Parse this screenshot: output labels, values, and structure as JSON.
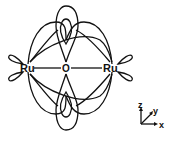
{
  "diagram": {
    "title": "",
    "atoms": [
      {
        "id": "ru-left",
        "label": "Ru",
        "x": 28,
        "y": 68
      },
      {
        "id": "o-center",
        "label": "O",
        "x": 66,
        "y": 68
      },
      {
        "id": "ru-right",
        "label": "Ru",
        "x": 112,
        "y": 68
      }
    ],
    "axes": {
      "z_label": "z",
      "y_label": "y",
      "x_label": "x"
    },
    "colors": {
      "stroke": "#111111",
      "background": "#ffffff"
    }
  }
}
